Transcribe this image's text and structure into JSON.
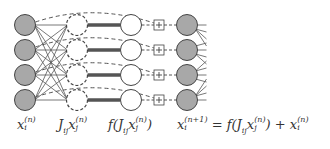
{
  "diagram": {
    "type": "neural-network-residual-update",
    "rows": 4,
    "colors": {
      "filled_node": "#a8a8a8",
      "node_stroke": "#444444",
      "edge": "#555555",
      "thick_edge": "#555555",
      "background": "#ffffff"
    },
    "columns": [
      {
        "name": "input-layer",
        "style": "filled-solid",
        "x": 25
      },
      {
        "name": "weighted-sum-layer",
        "style": "white-dashed",
        "x": 77
      },
      {
        "name": "activation-layer",
        "style": "white-solid",
        "x": 131
      },
      {
        "name": "adder",
        "style": "plus-box",
        "x": 159,
        "symbol": "+"
      },
      {
        "name": "output-layer",
        "style": "filled-solid",
        "x": 187
      }
    ],
    "row_y": [
      25,
      50,
      75,
      100
    ],
    "labels": {
      "input": {
        "base": "x",
        "sub": "i",
        "sup": "(n)"
      },
      "weighted": {
        "prefix": "J",
        "prefix_sub": "ij",
        "base": "x",
        "sub": "j",
        "sup": "(n)"
      },
      "activation": {
        "func": "f(",
        "prefix": "J",
        "prefix_sub": "ij",
        "base": "x",
        "sub": "j",
        "sup": "(n)",
        "close": ")"
      },
      "equation": {
        "lhs_base": "x",
        "lhs_sub": "i",
        "lhs_sup": "(n+1)",
        "equals": " = ",
        "func": "f(",
        "J": "J",
        "J_sub": "ij",
        "x": "x",
        "x_sub": "j",
        "x_sup": "(n)",
        "close": ")",
        "plus": " + ",
        "rhs_base": "x",
        "rhs_sub": "i",
        "rhs_sup": "(n)"
      }
    }
  }
}
